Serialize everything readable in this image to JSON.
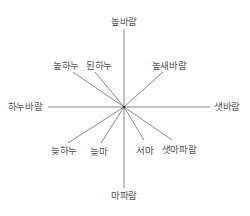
{
  "diagram": {
    "type": "wind-rose",
    "line_color": "#6b6b6b",
    "text_color": "#555555",
    "center": {
      "x": 124,
      "y": 107
    },
    "directions": [
      {
        "id": "north",
        "label": "높바람",
        "end": {
          "x": 124,
          "y": 29
        },
        "label_pos": {
          "x": 124,
          "y": 22
        }
      },
      {
        "id": "south",
        "label": "마파람",
        "end": {
          "x": 124,
          "y": 188
        },
        "label_pos": {
          "x": 124,
          "y": 196
        }
      },
      {
        "id": "west",
        "label": "하누바람",
        "end": {
          "x": 48,
          "y": 107
        },
        "label_pos": {
          "x": 25,
          "y": 107
        }
      },
      {
        "id": "east",
        "label": "샛바람",
        "end": {
          "x": 210,
          "y": 107
        },
        "label_pos": {
          "x": 227,
          "y": 107
        }
      },
      {
        "id": "northwest-outer",
        "label": "높하누",
        "end": {
          "x": 73,
          "y": 72
        },
        "label_pos": {
          "x": 66,
          "y": 66
        }
      },
      {
        "id": "northwest-inner",
        "label": "된하누",
        "end": {
          "x": 95,
          "y": 72
        },
        "label_pos": {
          "x": 99,
          "y": 66
        }
      },
      {
        "id": "northeast",
        "label": "높새바람",
        "end": {
          "x": 163,
          "y": 72
        },
        "label_pos": {
          "x": 169,
          "y": 66
        }
      },
      {
        "id": "southwest-outer",
        "label": "늦하누",
        "end": {
          "x": 68,
          "y": 143
        },
        "label_pos": {
          "x": 64,
          "y": 151
        }
      },
      {
        "id": "southwest-inner",
        "label": "늦마",
        "end": {
          "x": 101,
          "y": 143
        },
        "label_pos": {
          "x": 99,
          "y": 152
        }
      },
      {
        "id": "southeast-inner",
        "label": "서마",
        "end": {
          "x": 144,
          "y": 140
        },
        "label_pos": {
          "x": 145,
          "y": 151
        }
      },
      {
        "id": "southeast-outer",
        "label": "샛마파람",
        "end": {
          "x": 172,
          "y": 140
        },
        "label_pos": {
          "x": 179,
          "y": 150
        }
      }
    ]
  }
}
